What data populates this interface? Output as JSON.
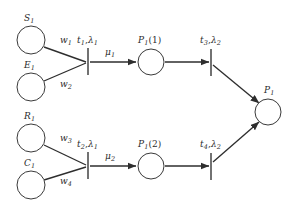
{
  "diagram": {
    "type": "petri-net",
    "background": "#ffffff",
    "stroke_color": "#2e2e2e",
    "label_color": "#2b2b2b"
  },
  "places": [
    {
      "id": "S1",
      "label_base": "S",
      "label_sub": "1",
      "label_tail": "",
      "cx": 31,
      "cy": 40,
      "r": 14,
      "label_x": 24,
      "label_y": 14
    },
    {
      "id": "E1",
      "label_base": "E",
      "label_sub": "1",
      "label_tail": "",
      "cx": 31,
      "cy": 87,
      "r": 14,
      "label_x": 24,
      "label_y": 61
    },
    {
      "id": "R1",
      "label_base": "R",
      "label_sub": "1",
      "label_tail": "",
      "cx": 31,
      "cy": 138,
      "r": 14,
      "label_x": 24,
      "label_y": 112
    },
    {
      "id": "C1",
      "label_base": "C",
      "label_sub": "1",
      "label_tail": "",
      "cx": 31,
      "cy": 185,
      "r": 14,
      "label_x": 24,
      "label_y": 159
    },
    {
      "id": "P1_1",
      "label_base": "P",
      "label_sub": "1",
      "label_tail": "(1)",
      "cx": 151,
      "cy": 62,
      "r": 13,
      "label_x": 138,
      "label_y": 36
    },
    {
      "id": "P1_2",
      "label_base": "P",
      "label_sub": "1",
      "label_tail": "(2)",
      "cx": 151,
      "cy": 166,
      "r": 13,
      "label_x": 138,
      "label_y": 140
    },
    {
      "id": "P1",
      "label_base": "P",
      "label_sub": "1",
      "label_tail": "",
      "cx": 268,
      "cy": 112,
      "r": 13,
      "label_x": 264,
      "label_y": 86
    }
  ],
  "transitions": [
    {
      "id": "t1",
      "x": 88,
      "y_top": 48,
      "y_bottom": 75,
      "name": "t",
      "sub": "1",
      "rate": "λ",
      "rate_sub": "1",
      "label_x": 77,
      "label_y": 36
    },
    {
      "id": "t2",
      "x": 88,
      "y_top": 152,
      "y_bottom": 179,
      "name": "t",
      "sub": "2",
      "rate": "λ",
      "rate_sub": "1",
      "label_x": 77,
      "label_y": 140
    },
    {
      "id": "t3",
      "x": 211,
      "y_top": 49,
      "y_bottom": 76,
      "name": "t",
      "sub": "3",
      "rate": "λ",
      "rate_sub": "2",
      "label_x": 200,
      "label_y": 36
    },
    {
      "id": "t4",
      "x": 211,
      "y_top": 153,
      "y_bottom": 180,
      "name": "t",
      "sub": "4",
      "rate": "λ",
      "rate_sub": "2",
      "label_x": 200,
      "label_y": 140
    }
  ],
  "arcs": [
    {
      "id": "S1-t1",
      "from": "S1",
      "to": "t1",
      "x1": 44,
      "y1": 47,
      "x2": 86,
      "y2": 62,
      "arrow": false
    },
    {
      "id": "E1-t1",
      "from": "E1",
      "to": "t1",
      "x1": 44,
      "y1": 81,
      "x2": 86,
      "y2": 63,
      "arrow": false
    },
    {
      "id": "t1-P1_1",
      "from": "t1",
      "to": "P1_1",
      "x1": 90,
      "y1": 62,
      "x2": 136,
      "y2": 62,
      "arrow": true
    },
    {
      "id": "P1_1-t3",
      "from": "P1_1",
      "to": "t3",
      "x1": 165,
      "y1": 62,
      "x2": 209,
      "y2": 62,
      "arrow": true
    },
    {
      "id": "t3-P1",
      "from": "t3",
      "to": "P1",
      "x1": 213,
      "y1": 65,
      "x2": 259,
      "y2": 103,
      "arrow": true
    },
    {
      "id": "R1-t2",
      "from": "R1",
      "to": "t2",
      "x1": 44,
      "y1": 145,
      "x2": 86,
      "y2": 165,
      "arrow": false
    },
    {
      "id": "C1-t2",
      "from": "C1",
      "to": "t2",
      "x1": 44,
      "y1": 180,
      "x2": 86,
      "y2": 167,
      "arrow": false
    },
    {
      "id": "t2-P1_2",
      "from": "t2",
      "to": "P1_2",
      "x1": 90,
      "y1": 166,
      "x2": 136,
      "y2": 166,
      "arrow": true
    },
    {
      "id": "P1_2-t4",
      "from": "P1_2",
      "to": "t4",
      "x1": 165,
      "y1": 166,
      "x2": 209,
      "y2": 166,
      "arrow": true
    },
    {
      "id": "t4-P1",
      "from": "t4",
      "to": "P1",
      "x1": 213,
      "y1": 162,
      "x2": 259,
      "y2": 122,
      "arrow": true
    }
  ],
  "arc_labels": [
    {
      "id": "w1",
      "base": "w",
      "sub": "1",
      "x": 60,
      "y": 36
    },
    {
      "id": "w2",
      "base": "w",
      "sub": "2",
      "x": 60,
      "y": 80
    },
    {
      "id": "w3",
      "base": "w",
      "sub": "3",
      "x": 60,
      "y": 134
    },
    {
      "id": "w4",
      "base": "w",
      "sub": "4",
      "x": 60,
      "y": 177
    },
    {
      "id": "mu1",
      "base": "μ",
      "sub": "1",
      "x": 105,
      "y": 48
    },
    {
      "id": "mu2",
      "base": "μ",
      "sub": "2",
      "x": 105,
      "y": 152
    }
  ]
}
